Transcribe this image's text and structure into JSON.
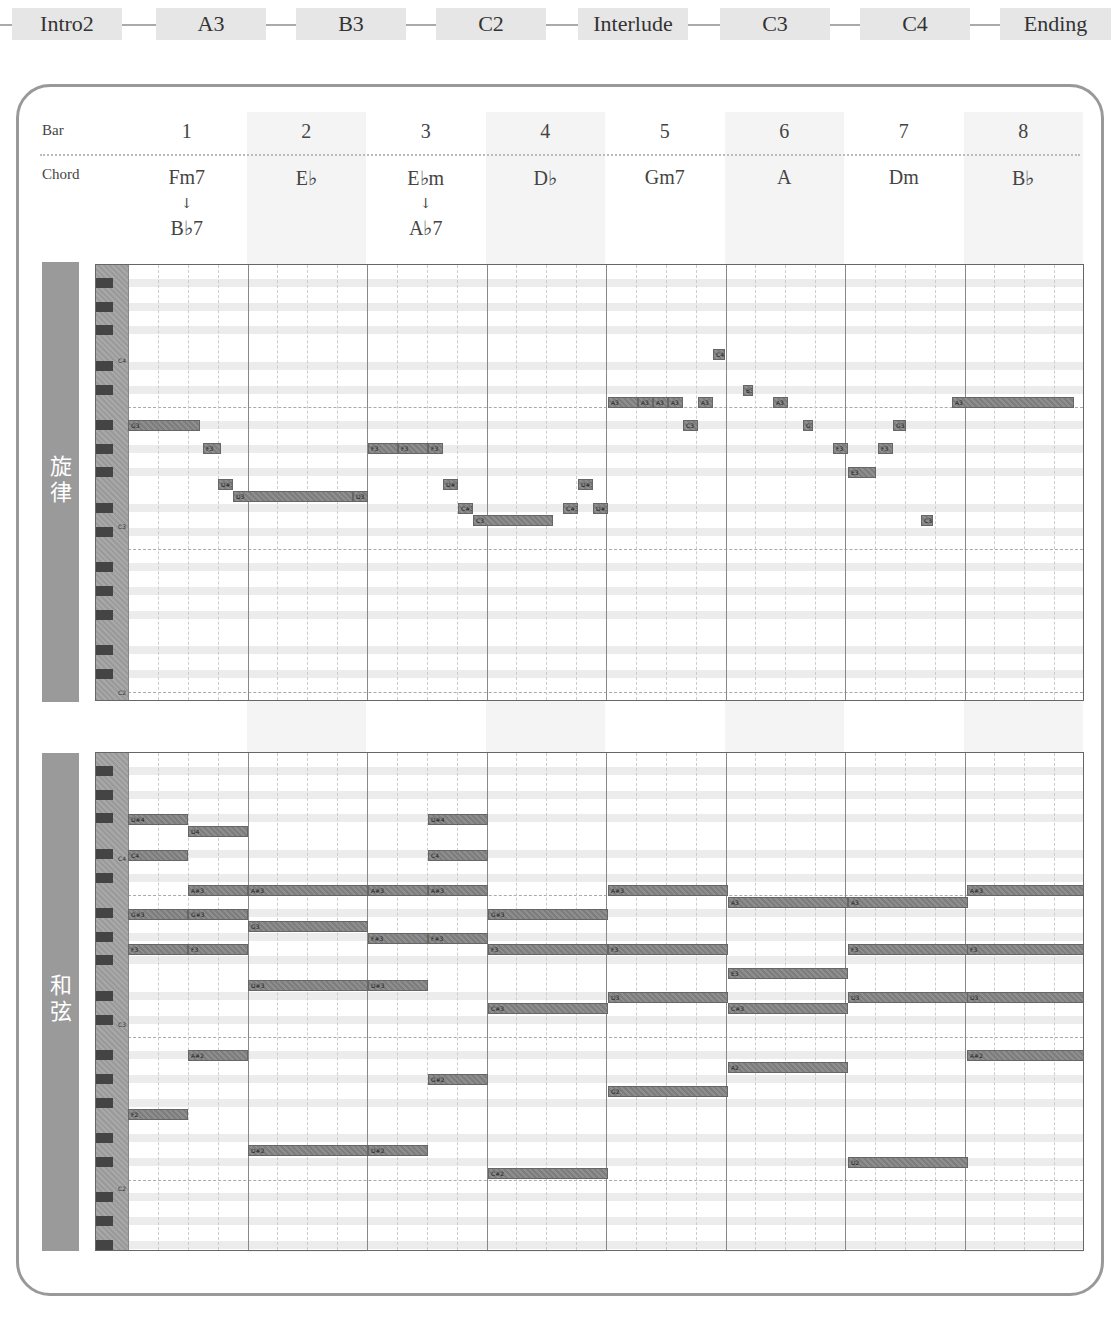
{
  "sections": [
    {
      "label": "Intro2",
      "x": 12,
      "w": 110
    },
    {
      "label": "A3",
      "x": 156,
      "w": 110
    },
    {
      "label": "B3",
      "x": 296,
      "w": 110
    },
    {
      "label": "C2",
      "x": 436,
      "w": 110
    },
    {
      "label": "Interlude",
      "x": 578,
      "w": 110
    },
    {
      "label": "C3",
      "x": 720,
      "w": 110
    },
    {
      "label": "C4",
      "x": 860,
      "w": 110
    },
    {
      "label": "Ending",
      "x": 1000,
      "w": 111
    }
  ],
  "header": {
    "bar_label": "Bar",
    "chord_label": "Chord",
    "bars": [
      {
        "num": "1",
        "chord": "Fm7",
        "chord2": "B♭7",
        "arrow": "↓"
      },
      {
        "num": "2",
        "chord": "E♭",
        "chord2": "",
        "arrow": ""
      },
      {
        "num": "3",
        "chord": "E♭m",
        "chord2": "A♭7",
        "arrow": "↓"
      },
      {
        "num": "4",
        "chord": "D♭",
        "chord2": "",
        "arrow": ""
      },
      {
        "num": "5",
        "chord": "Gm7",
        "chord2": "",
        "arrow": ""
      },
      {
        "num": "6",
        "chord": "A",
        "chord2": "",
        "arrow": ""
      },
      {
        "num": "7",
        "chord": "Dm",
        "chord2": "",
        "arrow": ""
      },
      {
        "num": "8",
        "chord": "B♭",
        "chord2": "",
        "arrow": ""
      }
    ]
  },
  "melody": {
    "title_line1": "旋",
    "title_line2": "律",
    "key_labels": [
      {
        "label": "C4",
        "y": 92
      },
      {
        "label": "C3",
        "y": 258
      },
      {
        "label": "C2",
        "y": 424
      }
    ],
    "notes": [
      {
        "label": "G3",
        "x": 32,
        "y": 155,
        "w": 72
      },
      {
        "label": "F3",
        "x": 107,
        "y": 178,
        "w": 18
      },
      {
        "label": "D#3",
        "x": 122,
        "y": 214,
        "w": 15
      },
      {
        "label": "D3",
        "x": 137,
        "y": 226,
        "w": 120
      },
      {
        "label": "D3",
        "x": 257,
        "y": 226,
        "w": 15
      },
      {
        "label": "F3",
        "x": 272,
        "y": 178,
        "w": 30
      },
      {
        "label": "F3",
        "x": 302,
        "y": 178,
        "w": 30
      },
      {
        "label": "F3",
        "x": 332,
        "y": 178,
        "w": 15
      },
      {
        "label": "D#3",
        "x": 347,
        "y": 214,
        "w": 15
      },
      {
        "label": "C#3",
        "x": 362,
        "y": 238,
        "w": 15
      },
      {
        "label": "C3",
        "x": 377,
        "y": 250,
        "w": 80
      },
      {
        "label": "C#3",
        "x": 467,
        "y": 238,
        "w": 15
      },
      {
        "label": "D#3",
        "x": 482,
        "y": 214,
        "w": 15
      },
      {
        "label": "D#3",
        "x": 497,
        "y": 238,
        "w": 15
      },
      {
        "label": "A3",
        "x": 512,
        "y": 132,
        "w": 30
      },
      {
        "label": "A3",
        "x": 542,
        "y": 132,
        "w": 15
      },
      {
        "label": "A3",
        "x": 557,
        "y": 132,
        "w": 15
      },
      {
        "label": "A3",
        "x": 572,
        "y": 132,
        "w": 15
      },
      {
        "label": "C3",
        "x": 587,
        "y": 155,
        "w": 15
      },
      {
        "label": "A3",
        "x": 602,
        "y": 132,
        "w": 15
      },
      {
        "label": "C4",
        "x": 617,
        "y": 84,
        "w": 12
      },
      {
        "label": "B3",
        "x": 647,
        "y": 120,
        "w": 10
      },
      {
        "label": "A3",
        "x": 677,
        "y": 132,
        "w": 15
      },
      {
        "label": "G3",
        "x": 707,
        "y": 155,
        "w": 10
      },
      {
        "label": "F3",
        "x": 737,
        "y": 178,
        "w": 15
      },
      {
        "label": "E3",
        "x": 752,
        "y": 202,
        "w": 28
      },
      {
        "label": "F3",
        "x": 782,
        "y": 178,
        "w": 15
      },
      {
        "label": "G3",
        "x": 797,
        "y": 155,
        "w": 13
      },
      {
        "label": "C3",
        "x": 825,
        "y": 250,
        "w": 12
      },
      {
        "label": "A3",
        "x": 856,
        "y": 132,
        "w": 122
      }
    ]
  },
  "harmony": {
    "title_line1": "和",
    "title_line2": "弦",
    "key_labels": [
      {
        "label": "C4",
        "y": 102
      },
      {
        "label": "C3",
        "y": 268
      },
      {
        "label": "C2",
        "y": 432
      }
    ],
    "notes": [
      {
        "label": "D#4",
        "x": 32,
        "y": 61,
        "w": 60
      },
      {
        "label": "C4",
        "x": 32,
        "y": 97,
        "w": 60
      },
      {
        "label": "G#3",
        "x": 32,
        "y": 156,
        "w": 60
      },
      {
        "label": "F3",
        "x": 32,
        "y": 191,
        "w": 60
      },
      {
        "label": "F2",
        "x": 32,
        "y": 356,
        "w": 60
      },
      {
        "label": "D4",
        "x": 92,
        "y": 73,
        "w": 60
      },
      {
        "label": "A#3",
        "x": 92,
        "y": 132,
        "w": 60
      },
      {
        "label": "G#3",
        "x": 92,
        "y": 156,
        "w": 60
      },
      {
        "label": "F3",
        "x": 92,
        "y": 191,
        "w": 60
      },
      {
        "label": "A#2",
        "x": 92,
        "y": 297,
        "w": 60
      },
      {
        "label": "A#3",
        "x": 152,
        "y": 132,
        "w": 120
      },
      {
        "label": "G3",
        "x": 152,
        "y": 168,
        "w": 120
      },
      {
        "label": "D#3",
        "x": 152,
        "y": 227,
        "w": 120
      },
      {
        "label": "D#2",
        "x": 152,
        "y": 392,
        "w": 120
      },
      {
        "label": "A#3",
        "x": 272,
        "y": 132,
        "w": 60
      },
      {
        "label": "F#3",
        "x": 272,
        "y": 180,
        "w": 60
      },
      {
        "label": "D#3",
        "x": 272,
        "y": 227,
        "w": 60
      },
      {
        "label": "D#2",
        "x": 272,
        "y": 392,
        "w": 60
      },
      {
        "label": "D#4",
        "x": 332,
        "y": 61,
        "w": 60
      },
      {
        "label": "C4",
        "x": 332,
        "y": 97,
        "w": 60
      },
      {
        "label": "A#3",
        "x": 332,
        "y": 132,
        "w": 60
      },
      {
        "label": "F#3",
        "x": 332,
        "y": 180,
        "w": 60
      },
      {
        "label": "G#2",
        "x": 332,
        "y": 321,
        "w": 60
      },
      {
        "label": "G#3",
        "x": 392,
        "y": 156,
        "w": 120
      },
      {
        "label": "F3",
        "x": 392,
        "y": 191,
        "w": 120
      },
      {
        "label": "C#3",
        "x": 392,
        "y": 250,
        "w": 120
      },
      {
        "label": "C#2",
        "x": 392,
        "y": 415,
        "w": 120
      },
      {
        "label": "A#3",
        "x": 512,
        "y": 132,
        "w": 120
      },
      {
        "label": "F3",
        "x": 512,
        "y": 191,
        "w": 120
      },
      {
        "label": "D3",
        "x": 512,
        "y": 239,
        "w": 120
      },
      {
        "label": "G2",
        "x": 512,
        "y": 333,
        "w": 120
      },
      {
        "label": "A3",
        "x": 632,
        "y": 144,
        "w": 120
      },
      {
        "label": "E3",
        "x": 632,
        "y": 215,
        "w": 120
      },
      {
        "label": "C#3",
        "x": 632,
        "y": 250,
        "w": 120
      },
      {
        "label": "A2",
        "x": 632,
        "y": 309,
        "w": 120
      },
      {
        "label": "A3",
        "x": 752,
        "y": 144,
        "w": 120
      },
      {
        "label": "F3",
        "x": 752,
        "y": 191,
        "w": 120
      },
      {
        "label": "D3",
        "x": 752,
        "y": 239,
        "w": 120
      },
      {
        "label": "D2",
        "x": 752,
        "y": 404,
        "w": 120
      },
      {
        "label": "A#3",
        "x": 871,
        "y": 132,
        "w": 118
      },
      {
        "label": "F3",
        "x": 871,
        "y": 191,
        "w": 118
      },
      {
        "label": "D3",
        "x": 871,
        "y": 239,
        "w": 118
      },
      {
        "label": "A#2",
        "x": 871,
        "y": 297,
        "w": 118
      }
    ]
  }
}
